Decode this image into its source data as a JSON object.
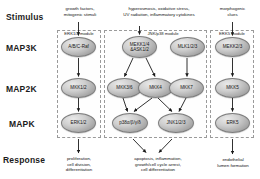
{
  "diagram": {
    "rows": [
      {
        "key": "stimulus",
        "label": "Stimulus"
      },
      {
        "key": "map3k",
        "label": "MAP3K"
      },
      {
        "key": "map2k",
        "label": "MAP2K"
      },
      {
        "key": "mapk",
        "label": "MAPK"
      },
      {
        "key": "response",
        "label": "Response"
      }
    ],
    "stimuli": [
      {
        "id": "stim-growth",
        "text": "growth factors,\nmitogenic stimuli"
      },
      {
        "id": "stim-stress",
        "text": "hyperosmosis, oxidative stress,\nUV radiation, inflammatory cytokines"
      },
      {
        "id": "stim-morpho",
        "text": "morphogenic\nclues"
      }
    ],
    "modules": [
      {
        "id": "module-erk12",
        "label": "ERK1/2 module"
      },
      {
        "id": "module-jnkp38",
        "label": "JNK/p38 module"
      },
      {
        "id": "module-erk5",
        "label": "ERK5 module"
      }
    ],
    "nodes": {
      "map3k": [
        {
          "id": "node-raf",
          "text": "A/B/C-Raf"
        },
        {
          "id": "node-mekk14-ask12",
          "text": "MEKK1/4\n&ASK1/2"
        },
        {
          "id": "node-mlk123",
          "text": "MLK1/2/3"
        },
        {
          "id": "node-mekk23",
          "text": "MEKK2/3"
        }
      ],
      "map2k": [
        {
          "id": "node-mkk12",
          "text": "MKK1/2"
        },
        {
          "id": "node-mkk36",
          "text": "MKK3/6"
        },
        {
          "id": "node-mkk4",
          "text": "MKK4"
        },
        {
          "id": "node-mkk7",
          "text": "MKK7"
        },
        {
          "id": "node-mkk5",
          "text": "MKK5"
        }
      ],
      "mapk": [
        {
          "id": "node-erk12",
          "text": "ERK1/2"
        },
        {
          "id": "node-p38",
          "text": "p38α/β/γ/δ"
        },
        {
          "id": "node-jnk123",
          "text": "JNK1/2/3"
        },
        {
          "id": "node-erk5",
          "text": "ERK5"
        }
      ]
    },
    "responses": [
      {
        "id": "resp-proliferation",
        "text": "proliferation,\ncell division,\ndifferentiation"
      },
      {
        "id": "resp-apoptosis",
        "text": "apoptosis, inflammation,\ngrowth/cell cycle arrest,\ncell differentiation"
      },
      {
        "id": "resp-lumen",
        "text": "endothelial\nlumen formation"
      }
    ],
    "colors": {
      "node_fill": "#b7b7b7",
      "node_stroke": "#7d7d7d",
      "panel_border": "#9a9a9a",
      "arrow": "#1a1a1a",
      "text": "#1a1a1a",
      "background": "#ffffff"
    }
  }
}
